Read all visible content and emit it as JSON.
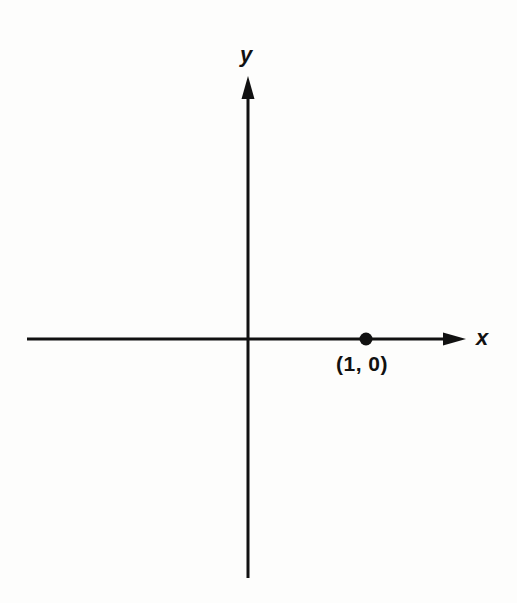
{
  "figure": {
    "background_color": "#fdfdfc",
    "stroke_color": "#111111",
    "axis_label_x": "x",
    "axis_label_y": "y",
    "point_label": "(1, 0)"
  },
  "chart_data": {
    "type": "scatter",
    "title": "",
    "subtitle": "",
    "xlabel": "x",
    "ylabel": "y",
    "grid": false,
    "legend": false,
    "legend_position": "none",
    "axis_style": "arrowed-cartesian-axes",
    "xlim": [
      -2.05,
      1.95
    ],
    "ylim": [
      -2.05,
      2.3
    ],
    "xticks": [],
    "yticks": [],
    "xticklabels": [],
    "yticklabels": [],
    "origin_pixel": [
      248,
      339
    ],
    "series": [
      {
        "name": "marked point",
        "marker": "filled-circle",
        "marker_color": "#111111",
        "marker_size": 12,
        "points": [
          {
            "x": 1,
            "y": 0,
            "label": "(1, 0)",
            "label_position": "below",
            "pixel_x": 366,
            "pixel_y": 339
          }
        ]
      }
    ],
    "annotations": [
      {
        "text": "x",
        "role": "x-axis-name",
        "pixel_x": 483,
        "pixel_y": 338,
        "style": "bold-italic"
      },
      {
        "text": "y",
        "role": "y-axis-name",
        "pixel_x": 247,
        "pixel_y": 55,
        "style": "bold-italic"
      },
      {
        "text": "(1, 0)",
        "role": "point-coordinates",
        "pixel_x": 365,
        "pixel_y": 366,
        "style": "bold"
      }
    ]
  },
  "geometry": {
    "x_axis": {
      "y": 339,
      "x_start": 27,
      "x_end": 466,
      "stroke_width": 3,
      "arrow_end": "right"
    },
    "y_axis": {
      "x": 248,
      "y_start": 76,
      "y_end": 578,
      "stroke_width": 3,
      "arrow_end": "top"
    },
    "arrowhead": {
      "length": 23,
      "width": 13
    },
    "point_dot": {
      "cx": 366,
      "cy": 339,
      "r": 6.5
    }
  }
}
